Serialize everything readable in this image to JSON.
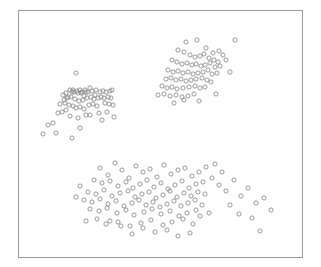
{
  "figure": {
    "width": 321,
    "height": 267,
    "background_color": "#ffffff"
  },
  "plot_frame": {
    "x": 18,
    "y": 10,
    "width": 284,
    "height": 247,
    "border_color": "#9a9a9a",
    "border_width": 1,
    "fill_color": "#ffffff"
  },
  "marker_style": {
    "shape": "open-circle",
    "radius": 2.1,
    "stroke_color": "#8c8c8c",
    "stroke_width": 0.9,
    "fill": "none"
  },
  "chart_data": {
    "type": "scatter",
    "title": "",
    "subtitle": "",
    "xlabel": "",
    "ylabel": "",
    "xlim": [
      18,
      302
    ],
    "ylim": [
      10,
      257
    ],
    "grid": false,
    "legend": null,
    "axis_ticks": false,
    "axis_tick_labels": false,
    "n_points": 204,
    "n_clusters": 3,
    "cluster_names": [
      "upper-left-cluster",
      "upper-right-cluster",
      "lower-cluster"
    ],
    "series": [
      {
        "name": "upper-left-cluster",
        "x": [
          76,
          73,
          86,
          90,
          95,
          68,
          72,
          78,
          80,
          82,
          84,
          63,
          66,
          70,
          74,
          77,
          81,
          85,
          88,
          92,
          96,
          100,
          103,
          106,
          110,
          112,
          64,
          67,
          71,
          75,
          79,
          83,
          87,
          91,
          94,
          98,
          101,
          104,
          108,
          111,
          60,
          65,
          69,
          73,
          76,
          80,
          84,
          89,
          93,
          97,
          105,
          109,
          113,
          58,
          62,
          70,
          78,
          86,
          99,
          107,
          48,
          53,
          43,
          56,
          80,
          102,
          114,
          72,
          66,
          90
        ],
        "y": [
          73,
          90,
          92,
          88,
          95,
          97,
          92,
          93,
          90,
          92,
          96,
          95,
          93,
          90,
          92,
          91,
          93,
          90,
          92,
          91,
          90,
          92,
          91,
          92,
          91,
          90,
          100,
          98,
          97,
          99,
          101,
          100,
          98,
          97,
          99,
          98,
          97,
          98,
          97,
          98,
          104,
          103,
          105,
          106,
          108,
          107,
          109,
          105,
          104,
          106,
          103,
          104,
          105,
          113,
          112,
          116,
          118,
          115,
          113,
          112,
          125,
          123,
          134,
          133,
          128,
          120,
          117,
          138,
          110,
          115
        ]
      },
      {
        "name": "upper-right-cluster",
        "x": [
          186,
          197,
          206,
          213,
          219,
          223,
          178,
          184,
          190,
          195,
          200,
          204,
          209,
          214,
          218,
          172,
          177,
          182,
          187,
          192,
          196,
          201,
          205,
          210,
          215,
          220,
          168,
          173,
          178,
          183,
          188,
          193,
          198,
          203,
          208,
          212,
          217,
          166,
          171,
          176,
          181,
          186,
          191,
          196,
          202,
          207,
          211,
          162,
          167,
          172,
          177,
          183,
          189,
          195,
          200,
          205,
          158,
          164,
          170,
          176,
          182,
          188,
          194,
          235,
          226,
          230,
          216,
          184,
          199,
          174
        ],
        "y": [
          42,
          40,
          48,
          53,
          51,
          55,
          50,
          52,
          55,
          57,
          56,
          54,
          58,
          60,
          62,
          60,
          62,
          64,
          63,
          65,
          64,
          66,
          65,
          63,
          67,
          66,
          70,
          72,
          71,
          73,
          72,
          74,
          73,
          72,
          70,
          74,
          73,
          79,
          78,
          80,
          79,
          81,
          80,
          79,
          78,
          80,
          82,
          86,
          88,
          87,
          89,
          88,
          87,
          86,
          88,
          87,
          95,
          94,
          96,
          95,
          97,
          96,
          94,
          40,
          60,
          72,
          94,
          100,
          101,
          103
        ]
      },
      {
        "name": "lower-cluster",
        "x": [
          100,
          108,
          115,
          122,
          129,
          136,
          143,
          150,
          157,
          164,
          171,
          178,
          185,
          192,
          199,
          206,
          94,
          102,
          110,
          118,
          126,
          133,
          140,
          147,
          154,
          161,
          168,
          175,
          182,
          189,
          196,
          203,
          88,
          96,
          104,
          112,
          120,
          128,
          135,
          142,
          149,
          156,
          163,
          170,
          177,
          184,
          191,
          198,
          205,
          84,
          92,
          100,
          108,
          116,
          124,
          132,
          139,
          146,
          153,
          160,
          167,
          174,
          181,
          188,
          195,
          202,
          80,
          90,
          99,
          107,
          117,
          126,
          134,
          144,
          152,
          161,
          170,
          179,
          187,
          196,
          76,
          86,
          97,
          106,
          118,
          130,
          141,
          151,
          163,
          172,
          183,
          193,
          212,
          219,
          226,
          234,
          241,
          248,
          256,
          264,
          271,
          215,
          222,
          230,
          239,
          252,
          260,
          155,
          167,
          178,
          190,
          143,
          132,
          121,
          110,
          200,
          209
        ],
        "y": [
          168,
          175,
          163,
          170,
          178,
          166,
          172,
          169,
          177,
          165,
          174,
          170,
          168,
          176,
          172,
          167,
          180,
          183,
          181,
          186,
          182,
          188,
          184,
          180,
          187,
          183,
          189,
          185,
          181,
          188,
          184,
          182,
          192,
          194,
          190,
          196,
          193,
          191,
          197,
          194,
          192,
          198,
          195,
          191,
          197,
          193,
          196,
          192,
          194,
          200,
          202,
          199,
          204,
          201,
          206,
          203,
          200,
          205,
          202,
          207,
          204,
          201,
          206,
          203,
          200,
          205,
          186,
          209,
          211,
          208,
          213,
          210,
          215,
          212,
          209,
          214,
          211,
          216,
          213,
          210,
          197,
          221,
          219,
          224,
          222,
          226,
          223,
          220,
          225,
          222,
          219,
          224,
          178,
          185,
          191,
          180,
          196,
          188,
          203,
          198,
          210,
          164,
          172,
          205,
          214,
          218,
          231,
          232,
          230,
          236,
          233,
          228,
          234,
          226,
          221,
          216,
          213
        ]
      }
    ]
  }
}
